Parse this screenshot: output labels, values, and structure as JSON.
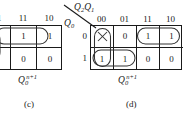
{
  "figure": {
    "type": "karnaugh-map-pair"
  },
  "kmap_c": {
    "caption_letter": "(c)",
    "output_expr": {
      "base": "Q",
      "sub": "0",
      "sup": "n+1"
    },
    "col_headers": [
      "01",
      "11",
      "10"
    ],
    "cells": [
      [
        "0",
        "1",
        "1"
      ],
      [
        "1",
        "0",
        "0"
      ]
    ],
    "cropped": true
  },
  "kmap_d": {
    "caption_letter": "(d)",
    "output_expr": {
      "base": "Q",
      "sub": "0",
      "sup": "n+1"
    },
    "col_var": {
      "base": "Q",
      "sub1": "2",
      "sub2": "1"
    },
    "col_var_text": "Q2Q1",
    "row_var": {
      "base": "Q",
      "sub": "0"
    },
    "row_var_text": "Q0",
    "col_headers": [
      "00",
      "01",
      "11",
      "10"
    ],
    "row_headers": [
      "0",
      "1"
    ],
    "cells": [
      [
        "×",
        "0",
        "1",
        "1"
      ],
      [
        "1",
        "1",
        "0",
        "0"
      ]
    ],
    "dont_care_cells": [
      [
        0,
        0
      ]
    ],
    "groups": [
      {
        "name": "group-top-right-pair",
        "row": 0,
        "cols": [
          2,
          3
        ]
      },
      {
        "name": "group-bottom-left-pair",
        "row": 1,
        "cols": [
          0,
          1
        ]
      },
      {
        "name": "group-left-column-vertical",
        "col": 0,
        "rows": [
          0,
          1
        ]
      }
    ],
    "cropped": false
  },
  "colors": {
    "ink": "#1a1a1a",
    "oval": "#333333",
    "background": "#ffffff"
  }
}
